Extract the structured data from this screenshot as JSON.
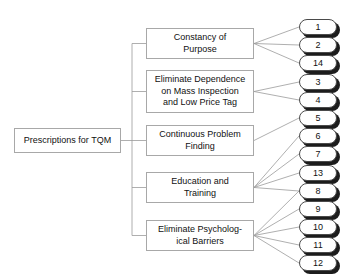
{
  "diagram": {
    "title": "Prescriptions for TQM",
    "type": "tree-diagram",
    "root": {
      "label": "Prescriptions for TQM"
    },
    "categories": [
      {
        "id": "cat-0",
        "label": "Constancy of\nPurpose",
        "points": [
          "1",
          "2",
          "14"
        ]
      },
      {
        "id": "cat-1",
        "label": "Eliminate Dependence\non Mass Inspection\nand Low Price Tag",
        "points": [
          "3",
          "4"
        ]
      },
      {
        "id": "cat-2",
        "label": "Continuous Problem\nFinding",
        "points": [
          "5"
        ]
      },
      {
        "id": "cat-3",
        "label": "Education and\nTraining",
        "points": [
          "6",
          "7",
          "13",
          "8"
        ]
      },
      {
        "id": "cat-4",
        "label": "Eliminate Psycholog-\nical Barriers",
        "points": [
          "8",
          "9",
          "10",
          "11",
          "12"
        ]
      }
    ],
    "points": [
      {
        "label": "1"
      },
      {
        "label": "2"
      },
      {
        "label": "14"
      },
      {
        "label": "3"
      },
      {
        "label": "4"
      },
      {
        "label": "5"
      },
      {
        "label": "6"
      },
      {
        "label": "7"
      },
      {
        "label": "13"
      },
      {
        "label": "8"
      },
      {
        "label": "9"
      },
      {
        "label": "10"
      },
      {
        "label": "11"
      },
      {
        "label": "12"
      }
    ],
    "colors": {
      "box_border": "#a8a8a8",
      "pill_border": "#4a4a4a",
      "pill_shadow": "#1c1c1c",
      "connector": "#9a9a9a",
      "text": "#111111",
      "background": "#ffffff"
    }
  }
}
